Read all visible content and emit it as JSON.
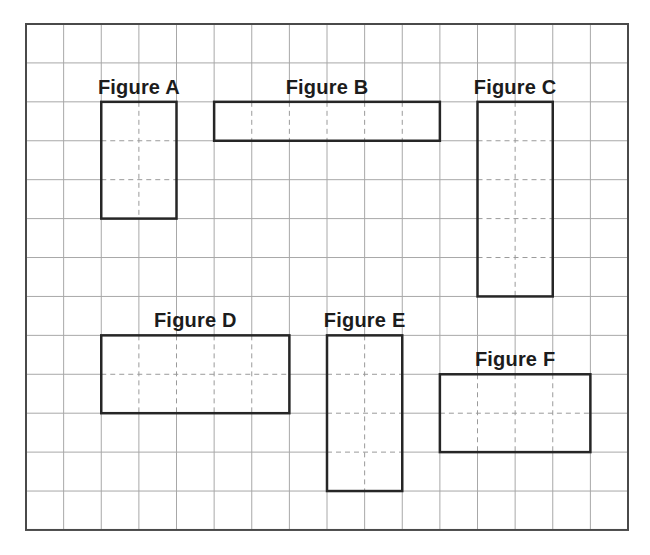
{
  "diagram": {
    "type": "grid-rectangles",
    "grid": {
      "columns": 16,
      "rows": 13,
      "origin_x": 26,
      "origin_y": 24,
      "cell_w": 37.625,
      "cell_h": 38.92,
      "line_color": "#a8a8a8",
      "border_color": "#4a4a4a"
    },
    "figure_stroke_color": "#262626",
    "dash_color": "#9a9a9a",
    "figures": [
      {
        "id": "A",
        "label": "Figure A",
        "col": 2,
        "row": 2,
        "width": 2,
        "height": 3
      },
      {
        "id": "B",
        "label": "Figure B",
        "col": 5,
        "row": 2,
        "width": 6,
        "height": 1
      },
      {
        "id": "C",
        "label": "Figure C",
        "col": 12,
        "row": 2,
        "width": 2,
        "height": 5
      },
      {
        "id": "D",
        "label": "Figure D",
        "col": 2,
        "row": 8,
        "width": 5,
        "height": 2
      },
      {
        "id": "E",
        "label": "Figure E",
        "col": 8,
        "row": 8,
        "width": 2,
        "height": 4
      },
      {
        "id": "F",
        "label": "Figure F",
        "col": 11,
        "row": 9,
        "width": 4,
        "height": 2
      }
    ]
  }
}
